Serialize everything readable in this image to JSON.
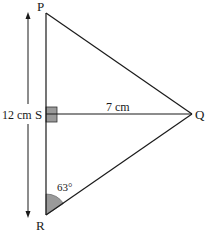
{
  "diagram": {
    "type": "geometry-triangle",
    "points": {
      "P": {
        "label": "P"
      },
      "Q": {
        "label": "Q"
      },
      "R": {
        "label": "R"
      },
      "S": {
        "label": "S"
      }
    },
    "measurements": {
      "PR_length": "12 cm",
      "SQ_length": "7 cm",
      "angle_R": "63°"
    },
    "markers": {
      "right_angle_at": "S",
      "shaded_angle_at": "R"
    },
    "colors": {
      "line": "#1a1a1a",
      "fill_marker": "#9a9a9a"
    }
  }
}
